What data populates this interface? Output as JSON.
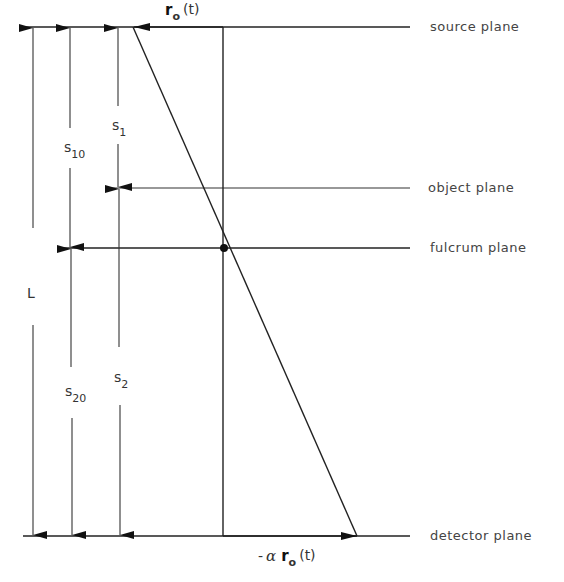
{
  "diagram": {
    "planes": [
      {
        "id": "source",
        "label": "source plane",
        "y": 27
      },
      {
        "id": "object",
        "label": "object plane",
        "y": 188
      },
      {
        "id": "fulcrum",
        "label": "fulcrum plane",
        "y": 248
      },
      {
        "id": "detector",
        "label": "detector plane",
        "y": 536
      }
    ],
    "dimensions": {
      "L": {
        "main": "L",
        "sub": ""
      },
      "s10": {
        "main": "s",
        "sub": "10"
      },
      "s20": {
        "main": "s",
        "sub": "20"
      },
      "s1": {
        "main": "s",
        "sub": "1"
      },
      "s2": {
        "main": "s",
        "sub": "2"
      }
    },
    "vectors": {
      "top": {
        "bold": "r",
        "sub": "o",
        "rest": "(t)"
      },
      "bottom": {
        "prefix": "-",
        "greek": "α",
        "bold": "r",
        "sub": "o",
        "rest": "(t)"
      }
    },
    "colors": {
      "ink": "#222222",
      "text": "#444444",
      "background": "#ffffff"
    }
  }
}
